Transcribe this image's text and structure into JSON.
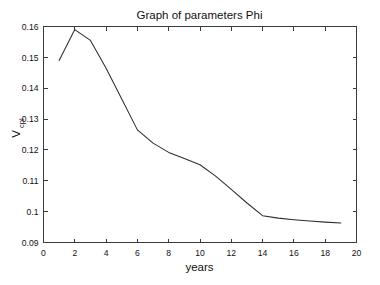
{
  "chart_data": {
    "type": "line",
    "title": "Graph of parameters Phi",
    "xlabel": "years",
    "ylabel": "V",
    "ylabel_subscript": "cpl",
    "xlim": [
      0,
      20
    ],
    "ylim": [
      0.09,
      0.16
    ],
    "grid": false,
    "legend": null,
    "x_ticks": [
      0,
      2,
      4,
      6,
      8,
      10,
      12,
      14,
      16,
      18,
      20
    ],
    "x_tick_labels": [
      "0",
      "2",
      "4",
      "6",
      "8",
      "10",
      "12",
      "14",
      "16",
      "18",
      "20"
    ],
    "y_ticks": [
      0.09,
      0.1,
      0.11,
      0.12,
      0.13,
      0.14,
      0.15,
      0.16
    ],
    "y_tick_labels": [
      "0.09",
      "0.1",
      "0.11",
      "0.12",
      "0.13",
      "0.14",
      "0.15",
      "0.16"
    ],
    "series": [
      {
        "name": "Phi",
        "color": "#2e2e2e",
        "x": [
          1,
          2,
          3,
          4,
          5,
          6,
          7,
          8,
          9,
          10,
          11,
          12,
          13,
          14,
          15,
          16,
          17,
          18,
          19
        ],
        "y": [
          0.149,
          0.159,
          0.1555,
          0.1465,
          0.1365,
          0.1265,
          0.1222,
          0.1192,
          0.1172,
          0.1152,
          0.1115,
          0.1072,
          0.1028,
          0.0987,
          0.0979,
          0.0974,
          0.097,
          0.0966,
          0.0963
        ]
      }
    ]
  },
  "figure": {
    "background": "#ffffff",
    "axis_color": "#3b3b3b",
    "text_color": "#111111"
  }
}
